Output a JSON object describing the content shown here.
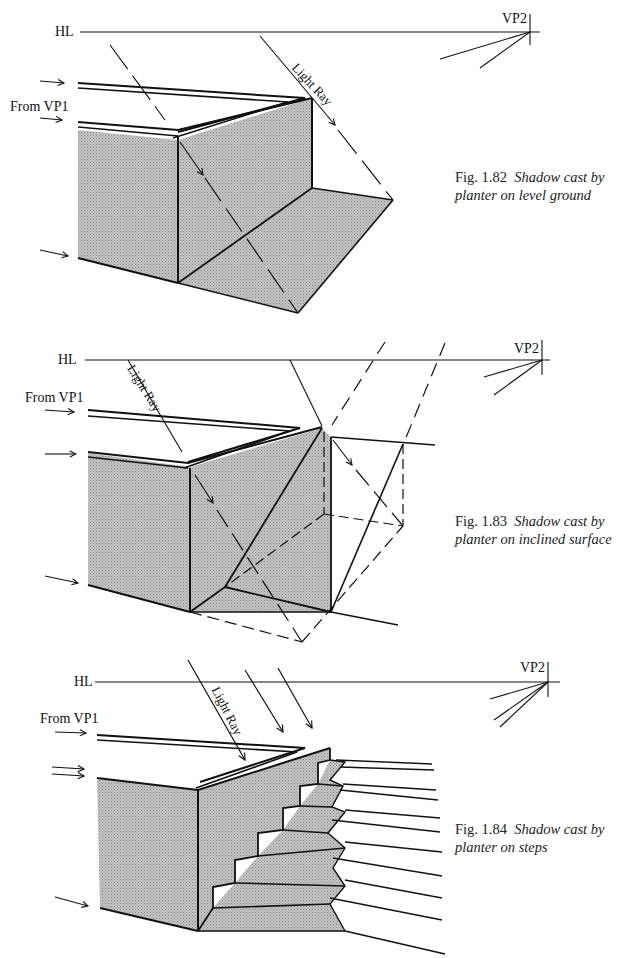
{
  "figures": [
    {
      "id": "fig-1-82",
      "hl_label": "HL",
      "vp2_label": "VP2",
      "from_vp1_label": "From VP1",
      "light_ray_label": "Light Ray",
      "caption_number": "Fig. 1.82",
      "caption_text_line1": "Shadow cast by",
      "caption_text_line2": "planter on level ground"
    },
    {
      "id": "fig-1-83",
      "hl_label": "HL",
      "vp2_label": "VP2",
      "from_vp1_label": "From VP1",
      "light_ray_label": "Light Ray",
      "caption_number": "Fig. 1.83",
      "caption_text_line1": "Shadow cast by",
      "caption_text_line2": "planter on inclined surface"
    },
    {
      "id": "fig-1-84",
      "hl_label": "HL",
      "vp2_label": "VP2",
      "from_vp1_label": "From VP1",
      "light_ray_label": "Light Ray",
      "caption_number": "Fig. 1.84",
      "caption_text_line1": "Shadow cast by",
      "caption_text_line2": "planter on steps"
    }
  ],
  "colors": {
    "ink": "#111111",
    "shade": "#b8b8b8",
    "paper": "#ffffff"
  }
}
